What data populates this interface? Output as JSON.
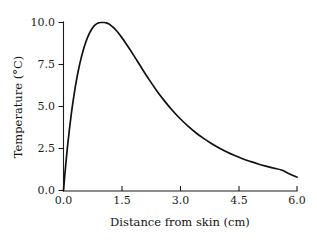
{
  "chart_data": {
    "type": "line",
    "title": "",
    "subtitle": "",
    "xlabel": "Distance from skin (cm)",
    "ylabel": "Temperature (°C)",
    "xlim": [
      0.0,
      6.0
    ],
    "ylim": [
      0.0,
      10.0
    ],
    "xticks": [
      0.0,
      1.5,
      3.0,
      4.5,
      6.0
    ],
    "xticklabels": [
      "0.0",
      "1.5",
      "3.0",
      "4.5",
      "6.0"
    ],
    "yticks": [
      0.0,
      2.5,
      5.0,
      7.5,
      10.0
    ],
    "yticklabels": [
      "0.0",
      "2.5",
      "5.0",
      "7.5",
      "10.0"
    ],
    "grid": false,
    "legend": false,
    "legend_position": "none",
    "line_color": "#111111",
    "series": [
      {
        "name": "Temperature profile",
        "x": [
          0.0,
          0.05,
          0.1,
          0.15,
          0.2,
          0.25,
          0.3,
          0.35,
          0.4,
          0.45,
          0.5,
          0.55,
          0.6,
          0.65,
          0.7,
          0.75,
          0.8,
          0.85,
          0.9,
          0.95,
          1.0,
          1.05,
          1.1,
          1.15,
          1.2,
          1.3,
          1.4,
          1.5,
          1.6,
          1.7,
          1.8,
          1.9,
          2.0,
          2.2,
          2.4,
          2.6,
          2.8,
          3.0,
          3.2,
          3.4,
          3.6,
          3.8,
          4.0,
          4.2,
          4.4,
          4.6,
          4.8,
          5.0,
          5.2,
          5.4,
          5.6,
          5.8,
          6.0
        ],
        "y": [
          0.0,
          1.35,
          2.55,
          3.6,
          4.55,
          5.38,
          6.12,
          6.77,
          7.35,
          7.85,
          8.29,
          8.67,
          9.0,
          9.28,
          9.51,
          9.69,
          9.83,
          9.92,
          9.98,
          10.0,
          10.0,
          10.0,
          9.98,
          9.93,
          9.86,
          9.66,
          9.4,
          9.1,
          8.77,
          8.42,
          8.06,
          7.69,
          7.32,
          6.6,
          5.93,
          5.32,
          4.76,
          4.27,
          3.83,
          3.44,
          3.1,
          2.8,
          2.53,
          2.29,
          2.08,
          1.89,
          1.73,
          1.58,
          1.45,
          1.33,
          1.22,
          1.0,
          0.8
        ]
      }
    ],
    "annotations": []
  },
  "axes": {
    "y_title": "Temperature (°C)",
    "x_title": "Distance from skin (cm)",
    "y_tick_labels": [
      "10.0",
      "7.5",
      "5.0",
      "2.5",
      "0.0"
    ],
    "x_tick_labels": [
      "0.0",
      "1.5",
      "3.0",
      "4.5",
      "6.0"
    ]
  }
}
